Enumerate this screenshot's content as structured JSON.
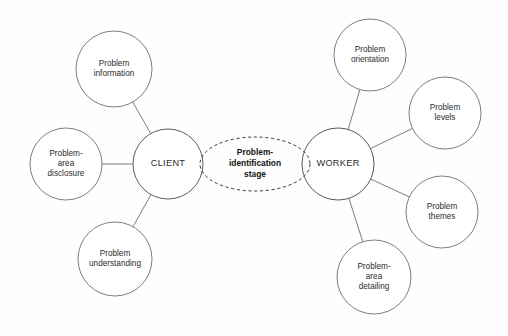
{
  "diagram": {
    "type": "node-link-diagram",
    "background_color": "#fefefe",
    "stroke_color": "#6e6e6e",
    "text_color": "#2b2b2b",
    "stage": {
      "id": "problem-identification-stage",
      "lines": [
        "Problem-",
        "identification",
        "stage"
      ],
      "shape": "dashed-ellipse",
      "cx": 255,
      "cy": 164,
      "rx": 55,
      "ry": 27,
      "bold": true
    },
    "hubs": [
      {
        "id": "client",
        "label": "CLIENT",
        "cx": 168,
        "cy": 164,
        "r": 35
      },
      {
        "id": "worker",
        "label": "WORKER",
        "cx": 338,
        "cy": 164,
        "r": 36
      }
    ],
    "nodes": [
      {
        "id": "problem-information",
        "lines": [
          "Problem",
          "information"
        ],
        "cx": 114,
        "cy": 69,
        "r": 38,
        "hub": "client"
      },
      {
        "id": "problem-area-disclosure",
        "lines": [
          "Problem-",
          "area",
          "disclosure"
        ],
        "cx": 66,
        "cy": 164,
        "r": 36,
        "hub": "client"
      },
      {
        "id": "problem-understanding",
        "lines": [
          "Problem",
          "understanding"
        ],
        "cx": 115,
        "cy": 259,
        "r": 37,
        "hub": "client"
      },
      {
        "id": "problem-orientation",
        "lines": [
          "Problem",
          "orientation"
        ],
        "cx": 370,
        "cy": 55,
        "r": 36,
        "hub": "worker"
      },
      {
        "id": "problem-levels",
        "lines": [
          "Problem",
          "levels"
        ],
        "cx": 445,
        "cy": 113,
        "r": 36,
        "hub": "worker"
      },
      {
        "id": "problem-themes",
        "lines": [
          "Problem",
          "themes"
        ],
        "cx": 442,
        "cy": 212,
        "r": 36,
        "hub": "worker"
      },
      {
        "id": "problem-area-detailing",
        "lines": [
          "Problem-",
          "area",
          "detailing"
        ],
        "cx": 374,
        "cy": 277,
        "r": 37,
        "hub": "worker"
      }
    ],
    "edges": [
      {
        "from": "client",
        "to": "problem-information"
      },
      {
        "from": "client",
        "to": "problem-area-disclosure"
      },
      {
        "from": "client",
        "to": "problem-understanding"
      },
      {
        "from": "worker",
        "to": "problem-orientation"
      },
      {
        "from": "worker",
        "to": "problem-levels"
      },
      {
        "from": "worker",
        "to": "problem-themes"
      },
      {
        "from": "worker",
        "to": "problem-area-detailing"
      }
    ]
  }
}
